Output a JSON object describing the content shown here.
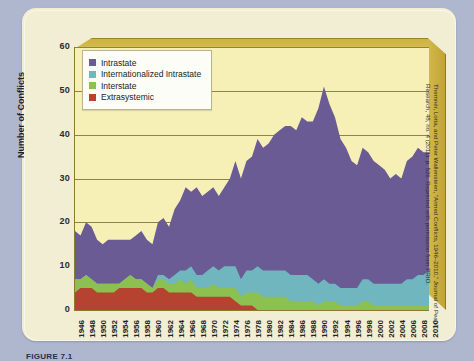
{
  "figure": {
    "caption": "FIGURE 7.1",
    "source_note": "Themnér, Lotta, and Peter Wallensteen, \"Armed Conflicts, 1946–2010,\" Journal of Peace Research, 48, no. 4 (2011): p. 526. Reprinted with permission from PRIO."
  },
  "legend": {
    "position": "top-left-inside",
    "items": [
      {
        "label": "Intrastate",
        "color": "#6b5b95"
      },
      {
        "label": "Internationalized Intrastate",
        "color": "#6fb6bf"
      },
      {
        "label": "Interstate",
        "color": "#8cc152"
      },
      {
        "label": "Extrasystemic",
        "color": "#b5432f"
      }
    ]
  },
  "chart_data": {
    "type": "area",
    "stacked": true,
    "title": "",
    "subtitle": "",
    "xlabel": "",
    "ylabel": "Number of Conflicts",
    "ylim": [
      0,
      60
    ],
    "yticks": [
      0,
      10,
      20,
      30,
      40,
      50,
      60
    ],
    "grid": true,
    "x_tick_step": 2,
    "x_tick_labels": [
      "1946",
      "1948",
      "1950",
      "1952",
      "1954",
      "1956",
      "1958",
      "1960",
      "1962",
      "1964",
      "1966",
      "1968",
      "1970",
      "1972",
      "1974",
      "1976",
      "1978",
      "1980",
      "1982",
      "1984",
      "1986",
      "1988",
      "1990",
      "1992",
      "1994",
      "1996",
      "1998",
      "2000",
      "2002",
      "2004",
      "2006",
      "2008",
      "2010"
    ],
    "x": [
      1946,
      1947,
      1948,
      1949,
      1950,
      1951,
      1952,
      1953,
      1954,
      1955,
      1956,
      1957,
      1958,
      1959,
      1960,
      1961,
      1962,
      1963,
      1964,
      1965,
      1966,
      1967,
      1968,
      1969,
      1970,
      1971,
      1972,
      1973,
      1974,
      1975,
      1976,
      1977,
      1978,
      1979,
      1980,
      1981,
      1982,
      1983,
      1984,
      1985,
      1986,
      1987,
      1988,
      1989,
      1990,
      1991,
      1992,
      1993,
      1994,
      1995,
      1996,
      1997,
      1998,
      1999,
      2000,
      2001,
      2002,
      2003,
      2004,
      2005,
      2006,
      2007,
      2008,
      2009,
      2010
    ],
    "series": [
      {
        "name": "Extrasystemic",
        "color": "#b5432f",
        "values": [
          4,
          5,
          5,
          5,
          4,
          4,
          4,
          4,
          5,
          5,
          5,
          5,
          5,
          4,
          4,
          5,
          5,
          4,
          4,
          4,
          4,
          4,
          3,
          3,
          3,
          3,
          3,
          3,
          3,
          2,
          1,
          1,
          1,
          0,
          0,
          0,
          0,
          0,
          0,
          0,
          0,
          0,
          0,
          0,
          0,
          0,
          0,
          0,
          0,
          0,
          0,
          0,
          0,
          0,
          0,
          0,
          0,
          0,
          0,
          0,
          0,
          0,
          0,
          0,
          0
        ]
      },
      {
        "name": "Interstate",
        "color": "#8cc152",
        "values": [
          3,
          2,
          3,
          2,
          2,
          2,
          2,
          2,
          1,
          2,
          3,
          2,
          2,
          2,
          1,
          2,
          2,
          2,
          2,
          3,
          2,
          3,
          2,
          2,
          2,
          3,
          2,
          2,
          2,
          3,
          2,
          3,
          3,
          4,
          3,
          3,
          3,
          3,
          3,
          2,
          2,
          2,
          2,
          2,
          1,
          2,
          2,
          2,
          1,
          1,
          1,
          1,
          2,
          2,
          1,
          1,
          1,
          1,
          1,
          1,
          1,
          1,
          1,
          1,
          1
        ]
      },
      {
        "name": "Internationalized Intrastate",
        "color": "#6fb6bf",
        "values": [
          0,
          0,
          0,
          0,
          0,
          0,
          0,
          0,
          0,
          0,
          0,
          0,
          0,
          0,
          0,
          1,
          1,
          1,
          2,
          2,
          3,
          3,
          3,
          3,
          4,
          4,
          4,
          5,
          5,
          5,
          4,
          5,
          5,
          6,
          6,
          6,
          6,
          6,
          6,
          6,
          6,
          6,
          6,
          5,
          5,
          5,
          4,
          4,
          4,
          4,
          4,
          4,
          5,
          5,
          5,
          5,
          5,
          5,
          5,
          5,
          6,
          6,
          7,
          7,
          8
        ]
      },
      {
        "name": "Intrastate",
        "color": "#6b5b95",
        "values": [
          11,
          10,
          12,
          12,
          10,
          9,
          10,
          10,
          10,
          9,
          8,
          10,
          11,
          10,
          10,
          12,
          13,
          12,
          15,
          16,
          19,
          17,
          20,
          18,
          18,
          18,
          17,
          18,
          20,
          24,
          23,
          25,
          26,
          29,
          28,
          29,
          31,
          32,
          33,
          34,
          33,
          36,
          35,
          36,
          40,
          44,
          41,
          38,
          34,
          32,
          29,
          28,
          30,
          29,
          28,
          27,
          26,
          24,
          25,
          24,
          27,
          28,
          29,
          28,
          27
        ]
      }
    ],
    "peak": {
      "year": 1991,
      "total": 51
    }
  }
}
